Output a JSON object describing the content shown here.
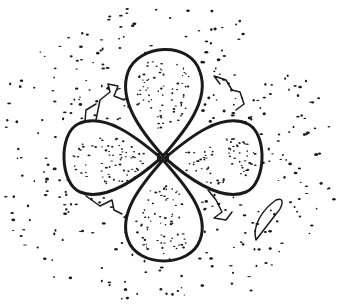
{
  "figure": {
    "ink_color": "#1a1a1a",
    "background": "#ffffff",
    "center": [
      163,
      158
    ],
    "lobes": [
      {
        "name": "top",
        "d": "M163,156 C140,130 118,100 128,72 C138,44 190,40 200,72 C210,100 186,130 163,156 Z"
      },
      {
        "name": "bottom",
        "d": "M163,160 C140,186 118,214 128,240 C138,268 190,268 200,240 C210,214 186,186 163,160 Z"
      },
      {
        "name": "left",
        "d": "M161,158 C135,136 104,112 78,124 C58,134 60,184 80,192 C104,202 136,180 161,158 Z"
      },
      {
        "name": "right",
        "d": "M165,158 C191,136 222,112 248,124 C268,134 266,184 246,192 C222,202 190,180 165,158 Z"
      }
    ],
    "scribbles": [
      "M96,120 L100,100 L110,92 L108,84 L118,86 L114,96 L124,100",
      "M84,132 L86,110 L96,104",
      "M220,84 L214,76 L226,80 L232,90 L240,92 L244,104 L236,110",
      "M208,190 L216,200 L222,212 L214,218 L226,220 L232,212",
      "M86,196 L100,206 L112,200 L114,210 L122,214",
      "M256,240 C252,226 262,210 276,200 C286,196 282,208 276,214 C270,222 262,232 256,240 Z"
    ]
  }
}
